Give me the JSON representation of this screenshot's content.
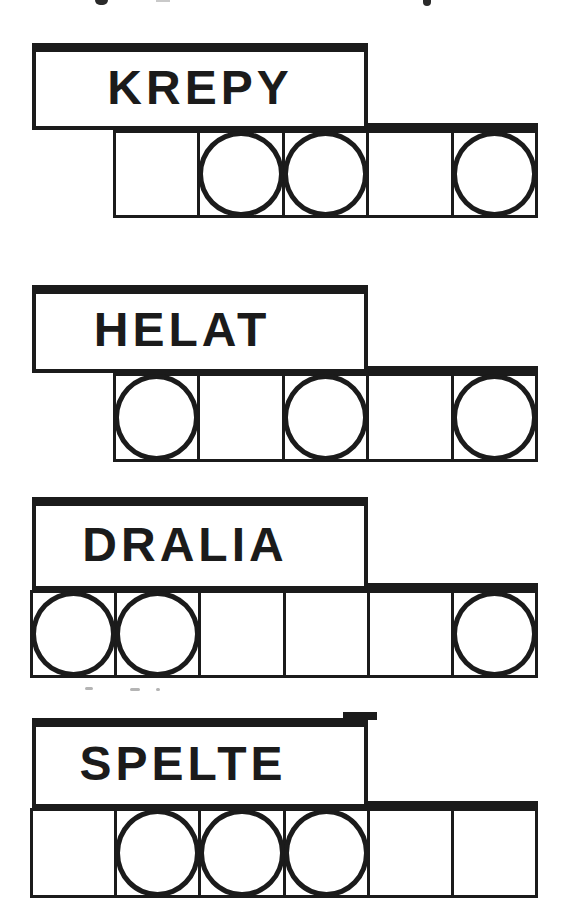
{
  "figure": {
    "background_color": "#ffffff",
    "ink_color": "#1b1b1b",
    "groups": [
      {
        "word": "KREPY",
        "cells": [
          "empty",
          "filled",
          "filled",
          "empty",
          "filled"
        ]
      },
      {
        "word": "HELAT",
        "cells": [
          "filled",
          "empty",
          "filled",
          "empty",
          "filled"
        ]
      },
      {
        "word": "DRALIA",
        "cells": [
          "filled",
          "filled",
          "empty",
          "empty",
          "empty",
          "filled"
        ]
      },
      {
        "word": "SPELTE",
        "cells": [
          "empty",
          "filled",
          "filled",
          "filled",
          "empty",
          "empty"
        ]
      }
    ]
  }
}
